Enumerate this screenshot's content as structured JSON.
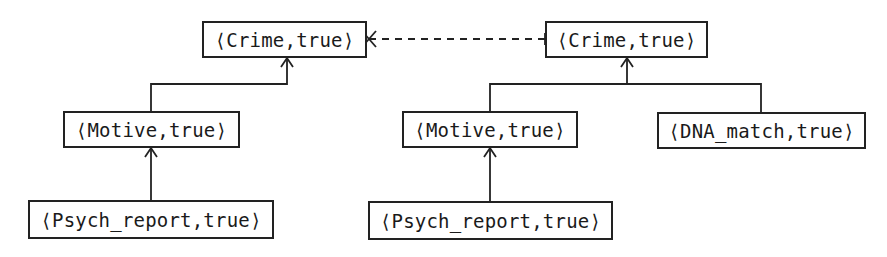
{
  "diagram": {
    "type": "argument-tree",
    "left_tree": {
      "root": {
        "id": "crime_left",
        "label": "⟨Crime,true⟩"
      },
      "children": [
        {
          "id": "motive_left",
          "label": "⟨Motive,true⟩",
          "children": [
            {
              "id": "psych_left",
              "label": "⟨Psych_report,true⟩"
            }
          ]
        }
      ]
    },
    "right_tree": {
      "root": {
        "id": "crime_right",
        "label": "⟨Crime,true⟩"
      },
      "children": [
        {
          "id": "motive_right",
          "label": "⟨Motive,true⟩",
          "children": [
            {
              "id": "psych_right",
              "label": "⟨Psych_report,true⟩"
            }
          ]
        },
        {
          "id": "dna_right",
          "label": "⟨DNA_match,true⟩"
        }
      ]
    },
    "attack_edge": {
      "from": "crime_right",
      "to": "crime_left",
      "style": "dashed",
      "marker": "cross"
    }
  },
  "nodes": {
    "crime_left": "⟨Crime,true⟩",
    "crime_right": "⟨Crime,true⟩",
    "motive_left": "⟨Motive,true⟩",
    "motive_right": "⟨Motive,true⟩",
    "psych_left": "⟨Psych_report,true⟩",
    "psych_right": "⟨Psych_report,true⟩",
    "dna_right": "⟨DNA_match,true⟩"
  }
}
